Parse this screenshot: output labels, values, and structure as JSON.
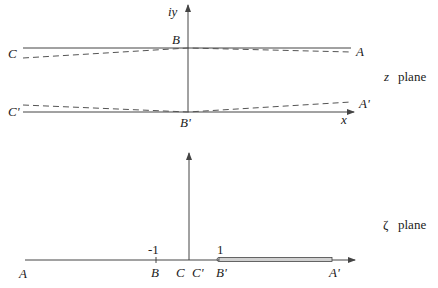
{
  "z_plane": {
    "title_symbol": "z",
    "title_word": "plane",
    "axis_labels": {
      "vertical": "iy",
      "horizontal": "x"
    },
    "points": {
      "A": "A",
      "B": "B",
      "C": "C",
      "A_prime": "A'",
      "B_prime": "B'",
      "C_prime": "C'"
    },
    "geometry": {
      "y_axis_x": 188,
      "upper_line_y": 48,
      "lower_line_y": 112,
      "line_x_start": 23,
      "line_x_end": 351,
      "dashed_upper": [
        [
          23,
          58
        ],
        [
          188,
          48
        ],
        [
          351,
          52
        ]
      ],
      "dashed_lower": [
        [
          23,
          105
        ],
        [
          188,
          112
        ],
        [
          351,
          102
        ]
      ]
    },
    "colors": {
      "line": "#444444",
      "dashed": "#555555"
    }
  },
  "zeta_plane": {
    "title_symbol": "ζ",
    "title_word": "plane",
    "ticks": {
      "minus_one": "-1",
      "one": "1"
    },
    "points": {
      "A": "A",
      "B": "B",
      "C": "C",
      "C_prime": "C'",
      "B_prime": "B'",
      "A_prime": "A'"
    },
    "geometry": {
      "axis_y": 260,
      "vertical_axis_x": 189,
      "axis_x_start": 25,
      "axis_x_end": 355,
      "tick_minus_one_x": 156,
      "slit_x_start": 218,
      "slit_x_end": 332
    },
    "colors": {
      "line": "#444444",
      "slit_fill": "#cccccc"
    }
  }
}
